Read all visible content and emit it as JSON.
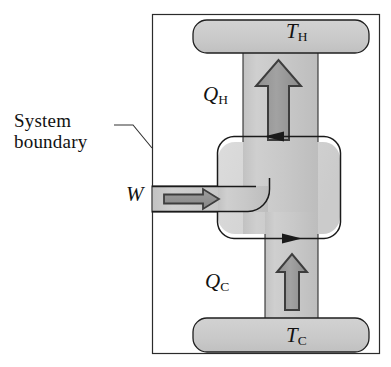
{
  "figure": {
    "kind": "thermodynamic-cycle-schematic"
  },
  "labels": {
    "system_boundary": {
      "line1": "System",
      "line2": "boundary"
    },
    "hot_reservoir": {
      "symbol": "T",
      "subscript": "H"
    },
    "cold_reservoir": {
      "symbol": "T",
      "subscript": "C"
    },
    "heat_out": {
      "symbol": "Q",
      "subscript": "H"
    },
    "heat_in": {
      "symbol": "Q",
      "subscript": "C"
    },
    "work_in": {
      "symbol": "W",
      "subscript": ""
    }
  },
  "icons": {
    "heat_out_arrow": "up-arrow-icon",
    "heat_in_arrow": "up-arrow-icon",
    "work_arrow": "right-arrow-icon",
    "boundary_flow_top": "left-arrowhead-icon",
    "boundary_flow_bottom": "right-arrowhead-icon",
    "leader_line": "leader-line-icon"
  },
  "colors": {
    "duct_fill": "#c9c9c9",
    "reservoir_fill": "#cccccc",
    "device_fill": "#d6d6d6",
    "arrow_fill": "#9a9a9a",
    "arrow_stroke": "#3d3d3d",
    "outline": "#1a1a1a",
    "frame": "#2b2b2b",
    "text": "#121212",
    "background": "#ffffff"
  },
  "geometry": {
    "frame": {
      "x": 152,
      "y": 14,
      "width": 228,
      "height": 340
    },
    "hot_reservoir_bar": {
      "x": 193,
      "y": 20,
      "width": 176,
      "height": 33
    },
    "cold_reservoir_bar": {
      "x": 193,
      "y": 318,
      "width": 176,
      "height": 34
    },
    "upper_duct": {
      "x": 243,
      "y": 52,
      "width": 75,
      "height": 96
    },
    "lower_duct": {
      "x": 265,
      "y": 228,
      "width": 53,
      "height": 92
    },
    "work_duct": {
      "x": 152,
      "y": 186,
      "width": 113,
      "height": 26
    },
    "device_box": {
      "x": 218,
      "y": 142,
      "width": 122,
      "height": 92,
      "radius": 16
    }
  }
}
